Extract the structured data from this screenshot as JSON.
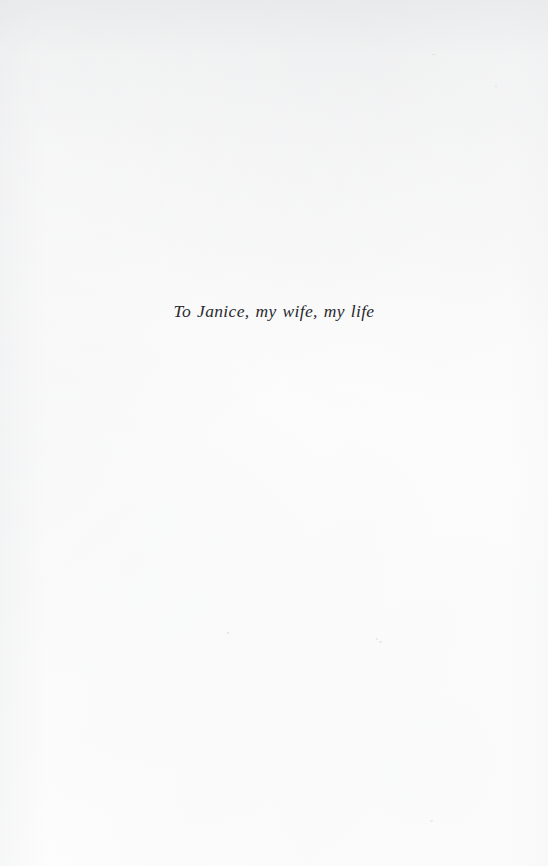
{
  "page": {
    "kind": "book-dedication-page",
    "width": 548,
    "height": 866,
    "background_color": "#fdfdfd",
    "ink_color": "#2a2a2e"
  },
  "dedication": {
    "text": "To Janice, my wife, my life"
  }
}
